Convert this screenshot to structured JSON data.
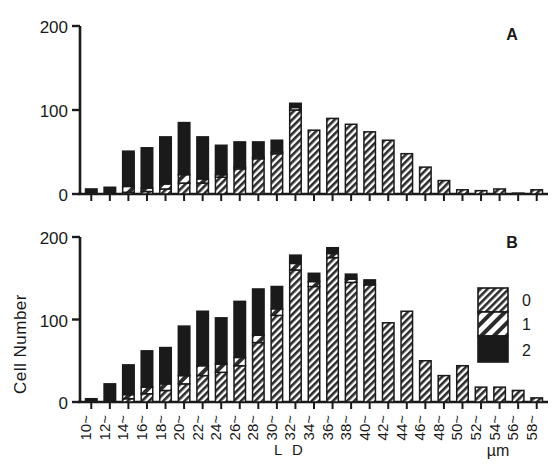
{
  "figure": {
    "y_axis_label": "Cell Number",
    "x_axis_title": "L D",
    "x_axis_unit": "µm",
    "panels": [
      {
        "label": "A"
      },
      {
        "label": "B"
      }
    ],
    "legend": {
      "entries": [
        {
          "label": "0",
          "pattern": "dense-hatch"
        },
        {
          "label": "1",
          "pattern": "wide-stripe"
        },
        {
          "label": "2",
          "pattern": "solid-black"
        }
      ]
    }
  },
  "chart_data": [
    {
      "type": "bar",
      "subtype": "stacked",
      "title": "A",
      "xlabel": "L D",
      "xunit": "µm",
      "ylabel": "Cell Number",
      "ylim": [
        0,
        200
      ],
      "yticks": [
        0,
        100,
        200
      ],
      "grid": false,
      "legend_position": "none",
      "categories": [
        "10~",
        "12~",
        "14~",
        "16~",
        "18~",
        "20~",
        "22~",
        "24~",
        "26~",
        "28~",
        "30~",
        "32~",
        "34~",
        "36~",
        "38~",
        "40~",
        "42~",
        "44~",
        "46~",
        "48~",
        "50~",
        "52~",
        "54~",
        "56~",
        "58~"
      ],
      "series": [
        {
          "name": "0",
          "pattern": "dense-hatch",
          "values": [
            0,
            0,
            2,
            3,
            6,
            13,
            13,
            20,
            30,
            42,
            48,
            100,
            76,
            90,
            83,
            74,
            64,
            48,
            32,
            16,
            5,
            4,
            6,
            1,
            5
          ]
        },
        {
          "name": "1",
          "pattern": "wide-stripe",
          "values": [
            0,
            0,
            7,
            4,
            6,
            10,
            5,
            3,
            2,
            2,
            2,
            3,
            0,
            0,
            0,
            0,
            0,
            0,
            0,
            0,
            0,
            0,
            0,
            0,
            0
          ]
        },
        {
          "name": "2",
          "pattern": "solid-black",
          "values": [
            6,
            8,
            42,
            48,
            56,
            62,
            50,
            35,
            30,
            18,
            14,
            5,
            0,
            0,
            0,
            0,
            0,
            0,
            0,
            0,
            0,
            0,
            0,
            0,
            0
          ]
        }
      ],
      "totals": [
        6,
        8,
        51,
        55,
        68,
        85,
        68,
        58,
        62,
        62,
        64,
        108,
        76,
        90,
        83,
        74,
        64,
        48,
        32,
        16,
        5,
        4,
        6,
        1,
        5
      ]
    },
    {
      "type": "bar",
      "subtype": "stacked",
      "title": "B",
      "xlabel": "L D",
      "xunit": "µm",
      "ylabel": "Cell Number",
      "ylim": [
        0,
        200
      ],
      "yticks": [
        0,
        100,
        200
      ],
      "grid": false,
      "legend_position": "top-right",
      "categories": [
        "10~",
        "12~",
        "14~",
        "16~",
        "18~",
        "20~",
        "22~",
        "24~",
        "26~",
        "28~",
        "30~",
        "32~",
        "34~",
        "36~",
        "38~",
        "40~",
        "42~",
        "44~",
        "46~",
        "48~",
        "50~",
        "52~",
        "54~",
        "56~",
        "58~"
      ],
      "series": [
        {
          "name": "0",
          "pattern": "dense-hatch",
          "values": [
            0,
            0,
            4,
            10,
            14,
            22,
            32,
            36,
            44,
            72,
            105,
            160,
            140,
            175,
            145,
            142,
            96,
            110,
            50,
            32,
            44,
            18,
            18,
            14,
            5
          ]
        },
        {
          "name": "1",
          "pattern": "wide-stripe",
          "values": [
            0,
            0,
            5,
            8,
            8,
            10,
            12,
            10,
            10,
            9,
            8,
            8,
            6,
            5,
            4,
            0,
            0,
            0,
            0,
            0,
            0,
            0,
            0,
            0,
            0
          ]
        },
        {
          "name": "2",
          "pattern": "solid-black",
          "values": [
            4,
            22,
            36,
            44,
            44,
            60,
            66,
            56,
            68,
            56,
            27,
            10,
            10,
            7,
            6,
            6,
            0,
            0,
            0,
            0,
            0,
            0,
            0,
            0,
            0
          ]
        }
      ],
      "totals": [
        4,
        22,
        45,
        62,
        66,
        92,
        110,
        102,
        122,
        137,
        140,
        178,
        156,
        187,
        155,
        148,
        96,
        110,
        50,
        32,
        44,
        18,
        18,
        14,
        5
      ]
    }
  ]
}
